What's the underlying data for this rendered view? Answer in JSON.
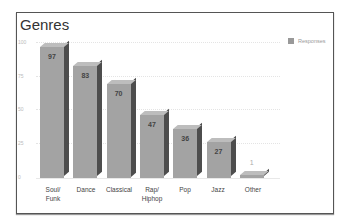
{
  "chart_data": {
    "type": "bar",
    "title": "Genres",
    "categories": [
      "Soul/ Funk",
      "Dance",
      "Classical",
      "Rap/ Hiphop",
      "Pop",
      "Jazz",
      "Other"
    ],
    "series": [
      {
        "name": "Responses",
        "values": [
          97,
          83,
          70,
          47,
          36,
          27,
          1
        ]
      }
    ],
    "values": [
      97,
      83,
      70,
      47,
      36,
      27,
      1
    ],
    "xlabel": "",
    "ylabel": "",
    "ylim": [
      0,
      100
    ],
    "yticks": [
      "100",
      "75",
      "50",
      "25",
      "0"
    ],
    "grid": true,
    "legend_position": "top-right",
    "bar_style": "3d",
    "bar_color": "#a3a3a3"
  },
  "legend": {
    "label": "Responses"
  },
  "labels": {
    "cat0": "Soul/",
    "cat0b": "Funk",
    "cat1": "Dance",
    "cat2": "Classical",
    "cat3": "Rap/",
    "cat3b": "Hiphop",
    "cat4": "Pop",
    "cat5": "Jazz",
    "cat6": "Other"
  },
  "value_labels": [
    "97",
    "83",
    "70",
    "47",
    "36",
    "27",
    "1"
  ]
}
